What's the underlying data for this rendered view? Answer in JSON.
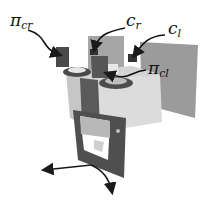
{
  "figure": {
    "labels": [
      {
        "id": "pi_cr",
        "main": "π",
        "sub": "cr"
      },
      {
        "id": "c_r",
        "main": "c",
        "sub": "r"
      },
      {
        "id": "c_l",
        "main": "c",
        "sub": "l"
      },
      {
        "id": "pi_cl",
        "main": "π",
        "sub": "cl"
      }
    ]
  }
}
